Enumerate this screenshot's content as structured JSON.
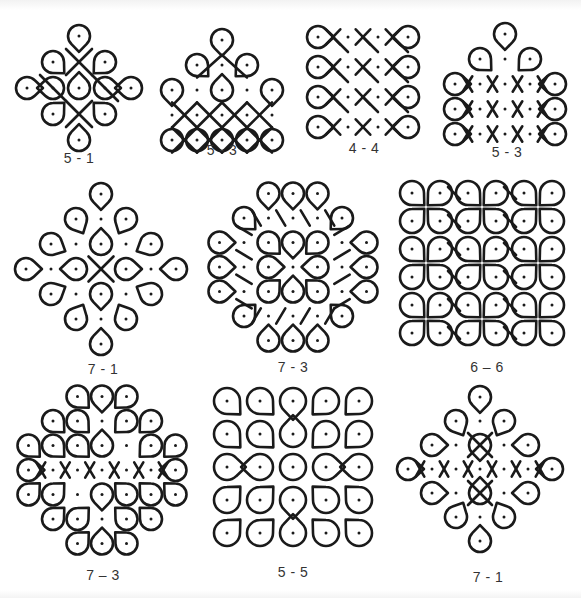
{
  "stroke_color": "#1a1a1a",
  "figures": [
    {
      "id": "fig1",
      "caption": "5 - 1",
      "grid": "5-1",
      "caption_x": 79,
      "caption_y": 158
    },
    {
      "id": "fig2",
      "caption": "5 - 3",
      "grid": "5-3",
      "caption_x": 222,
      "caption_y": 150
    },
    {
      "id": "fig3",
      "caption": "4 - 4",
      "grid": "4-4",
      "caption_x": 364,
      "caption_y": 148
    },
    {
      "id": "fig4",
      "caption": "5 - 3",
      "grid": "5-3",
      "caption_x": 507,
      "caption_y": 152
    },
    {
      "id": "fig5",
      "caption": "7 - 1",
      "grid": "7-1",
      "caption_x": 103,
      "caption_y": 362
    },
    {
      "id": "fig6",
      "caption": "7 - 3",
      "grid": "7-3",
      "caption_x": 293,
      "caption_y": 360
    },
    {
      "id": "fig7",
      "caption": "6 – 6",
      "grid": "6-6",
      "caption_x": 487,
      "caption_y": 360
    },
    {
      "id": "fig8",
      "caption": "7 – 3",
      "grid": "7-3",
      "caption_x": 103,
      "caption_y": 568
    },
    {
      "id": "fig9",
      "caption": "5 - 5",
      "grid": "5-5",
      "caption_x": 293,
      "caption_y": 565
    },
    {
      "id": "fig10",
      "caption": "7 - 1",
      "grid": "7-1",
      "caption_x": 488,
      "caption_y": 570
    }
  ]
}
